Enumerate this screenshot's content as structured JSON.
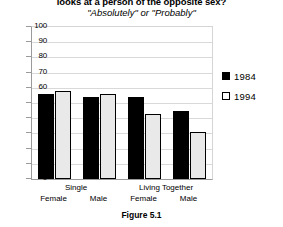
{
  "chart_data": {
    "type": "bar",
    "title": "looks at a person of the opposite sex?",
    "subtitle": "\"Absolutely\" or \"Probably\"",
    "caption": "Figure 5.1",
    "categories": [
      "Female",
      "Male",
      "Female",
      "Male"
    ],
    "groups": [
      {
        "name": "Single",
        "categories": [
          "Female",
          "Male"
        ]
      },
      {
        "name": "Living Together",
        "categories": [
          "Female",
          "Male"
        ]
      }
    ],
    "series": [
      {
        "name": "1984",
        "color": "#000000",
        "values": [
          56,
          54,
          54,
          45
        ]
      },
      {
        "name": "1994",
        "color": "#e9e9e9",
        "values": [
          58,
          56,
          43,
          31
        ]
      }
    ],
    "legend": [
      "1984",
      "1994"
    ],
    "legend_position": "right",
    "xlabel": "",
    "ylabel": "",
    "ylim": [
      0,
      100
    ],
    "yticks": [
      0,
      10,
      20,
      30,
      40,
      50,
      60,
      70,
      80,
      90,
      100
    ],
    "ytick_labels": [
      "0",
      "10",
      "20",
      "30",
      "40",
      "50",
      "60",
      "70",
      "80",
      "90",
      "100"
    ],
    "grid": true
  }
}
